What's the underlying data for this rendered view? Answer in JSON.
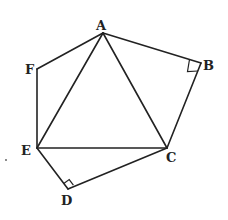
{
  "diagram": {
    "type": "geometry-figure",
    "colors": {
      "line": "#222222",
      "background": "#ffffff"
    },
    "points": {
      "A": {
        "label": "A",
        "x": 103,
        "y": 33
      },
      "B": {
        "label": "B",
        "x": 201,
        "y": 63
      },
      "C": {
        "label": "C",
        "x": 167,
        "y": 148
      },
      "D": {
        "label": "D",
        "x": 68,
        "y": 189
      },
      "E": {
        "label": "E",
        "x": 37,
        "y": 148
      },
      "F": {
        "label": "F",
        "x": 37,
        "y": 69
      }
    },
    "edges": [
      [
        "A",
        "B"
      ],
      [
        "B",
        "C"
      ],
      [
        "C",
        "D"
      ],
      [
        "D",
        "E"
      ],
      [
        "E",
        "F"
      ],
      [
        "F",
        "A"
      ],
      [
        "A",
        "C"
      ],
      [
        "C",
        "E"
      ],
      [
        "E",
        "A"
      ]
    ],
    "right_angles": [
      "B",
      "D"
    ]
  }
}
